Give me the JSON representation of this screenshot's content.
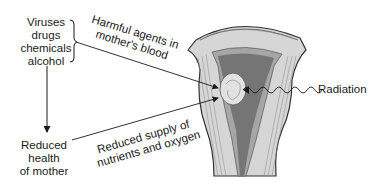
{
  "diagram": {
    "sources": [
      "Viruses",
      "drugs",
      "chemicals",
      "alcohol"
    ],
    "path_harmful": [
      "Harmful agents in",
      "mother's blood"
    ],
    "reduced_health": [
      "Reduced",
      "health",
      "of mother"
    ],
    "path_nutrients": [
      "Reduced supply of",
      "nutrients and oxygen"
    ],
    "radiation_label": "Radiation",
    "colors": {
      "ink": "#1a1a1a",
      "muscle": "#d8d8d8",
      "cavity": "#7a7a7a",
      "lining": "#a8a8a8",
      "embryo": "#e4e4e4"
    }
  }
}
